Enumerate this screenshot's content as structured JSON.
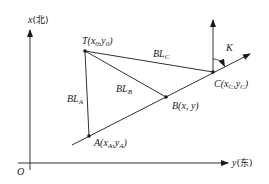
{
  "diagram": {
    "type": "coordinate-geometry",
    "axes": {
      "vertical_label": "x",
      "vertical_direction": "北",
      "horizontal_label": "y",
      "horizontal_direction": "东",
      "origin_label": "O"
    },
    "points": [
      {
        "id": "T",
        "label": "T",
        "coords": "x0, y0",
        "sub1": "0",
        "sub2": "0",
        "px": [
          85,
          51
        ]
      },
      {
        "id": "A",
        "label": "A",
        "sub1": "A",
        "sub2": "A",
        "px": [
          89,
          136
        ]
      },
      {
        "id": "B",
        "label": "B",
        "coords": "x, y",
        "px": [
          166,
          97
        ]
      },
      {
        "id": "C",
        "label": "C",
        "sub1": "C",
        "sub2": "C",
        "px": [
          213,
          72
        ]
      }
    ],
    "segments": [
      {
        "from": "T",
        "to": "A",
        "label": "BL",
        "sub": "A"
      },
      {
        "from": "T",
        "to": "B",
        "label": "BL",
        "sub": "B"
      },
      {
        "from": "T",
        "to": "C",
        "label": "BL",
        "sub": "C"
      },
      {
        "from": "A",
        "to": "C",
        "label": "",
        "note": "line through A, B, C with arrow beyond C"
      }
    ],
    "angle": {
      "label": "K",
      "at": "C",
      "between": "north direction and line AC"
    },
    "colors": {
      "stroke": "#1a1a1a",
      "background": "#ffffff"
    }
  }
}
